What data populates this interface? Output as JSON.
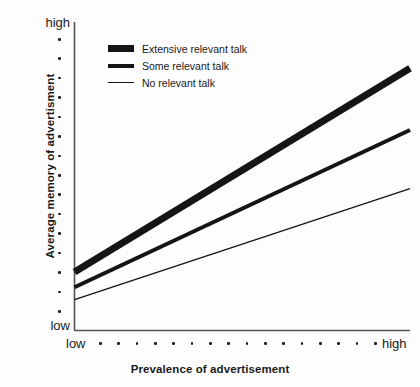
{
  "chart_data": {
    "type": "line",
    "title": "",
    "xlabel": "Prevalence of advertisement",
    "ylabel": "Average memory of advertisment",
    "x_tick_labels": [
      "low",
      "high"
    ],
    "y_tick_labels": [
      "low",
      "high"
    ],
    "x_tick_dot_count": 16,
    "y_tick_dot_count": 15,
    "grid": false,
    "legend_position": "top-left-inside",
    "xlim": [
      0,
      100
    ],
    "ylim": [
      0,
      100
    ],
    "series": [
      {
        "name": "Extensive relevant talk",
        "line_width": 7,
        "color": "#151515",
        "x": [
          0,
          100
        ],
        "values": [
          19,
          85
        ]
      },
      {
        "name": "Some relevant talk",
        "line_width": 4,
        "color": "#151515",
        "x": [
          0,
          100
        ],
        "values": [
          14,
          65
        ]
      },
      {
        "name": "No relevant talk",
        "line_width": 1.4,
        "color": "#151515",
        "x": [
          0,
          100
        ],
        "values": [
          10,
          46
        ]
      }
    ]
  },
  "axes": {
    "y_high_label": "high",
    "y_low_label": "low",
    "x_low_label": "low",
    "x_high_label": "high",
    "x_axis_title": "Prevalence of advertisement",
    "y_axis_title": "Average memory of advertisment"
  },
  "legend": {
    "items": [
      {
        "label": "Extensive relevant talk",
        "swatch": "thick-line-swatch"
      },
      {
        "label": "Some relevant talk",
        "swatch": "medium-line-swatch"
      },
      {
        "label": "No relevant talk",
        "swatch": "thin-line-swatch"
      }
    ]
  },
  "colors": {
    "ink": "#151515",
    "axis": "#555555",
    "background": "#fdfdfd"
  }
}
